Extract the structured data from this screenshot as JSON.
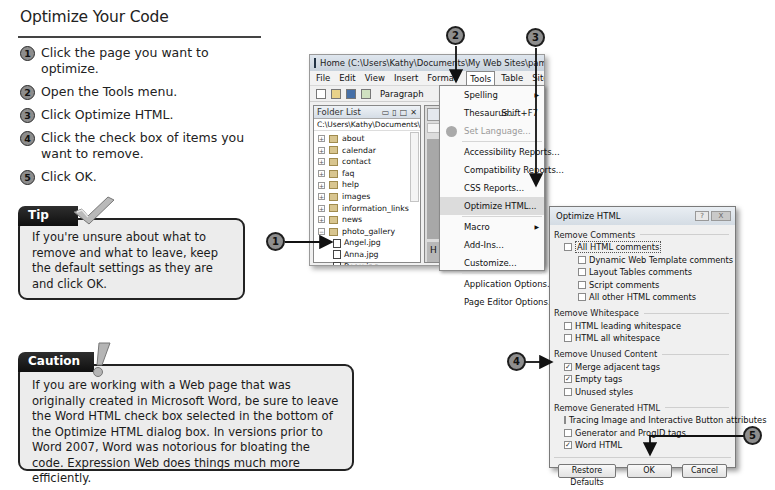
{
  "title": "Optimize Your Code",
  "steps": [
    {
      "num": "1",
      "text": "Click the page you want to optimize."
    },
    {
      "num": "2",
      "text": "Open the Tools menu."
    },
    {
      "num": "3",
      "text": "Click Optimize HTML."
    },
    {
      "num": "4",
      "text": "Click the check box of items you want to remove."
    },
    {
      "num": "5",
      "text": "Click OK."
    }
  ],
  "tip": {
    "heading": "Tip",
    "icon": "checkmark-icon",
    "text": "If you're unsure about what to remove and what to leave, keep the default settings as they are and click OK."
  },
  "caution": {
    "heading": "Caution",
    "icon": "exclamation-icon",
    "text": "If you are working with a Web page that was originally created in Microsoft Word, be sure to leave the Word HTML check box selected in the bottom of the Optimize HTML dialog box. In versions prior to Word 2007, Word was notorious for bloating the code. Expression Web does things much more efficiently."
  },
  "app": {
    "window_title": "Home (C:\\Users\\Kathy\\Documents\\My Web Sites\\pampered_pooches\\def",
    "menubar": [
      "File",
      "Edit",
      "View",
      "Insert",
      "Format",
      "Tools",
      "Table",
      "Site",
      "Data View"
    ],
    "toolbar": {
      "style_select": "Paragraph"
    },
    "folder_list": {
      "title": "Folder List",
      "path": "C:\\Users\\Kathy\\Documents\\M",
      "folders": [
        "about",
        "calendar",
        "contact",
        "faq",
        "help",
        "images",
        "information_links",
        "news",
        "photo_gallery"
      ],
      "files": [
        "Angel.jpg",
        "Anna.jpg",
        "Beau.jpg"
      ]
    },
    "editor": {
      "heading_fragment": "H"
    }
  },
  "tools_menu": {
    "items": [
      {
        "label": "Spelling",
        "shortcut": "",
        "submenu": true
      },
      {
        "label": "Thesaurus...",
        "shortcut": "Shift+F7"
      },
      {
        "label": "Set Language...",
        "disabled": true
      },
      {
        "label": "Accessibility Reports..."
      },
      {
        "label": "Compatibility Reports..."
      },
      {
        "label": "CSS Reports..."
      },
      {
        "label": "Optimize HTML...",
        "highlighted": true
      },
      {
        "label": "Macro",
        "submenu": true
      },
      {
        "label": "Add-Ins..."
      },
      {
        "label": "Customize..."
      },
      {
        "label": "Application Options..."
      },
      {
        "label": "Page Editor Options..."
      }
    ]
  },
  "dialog": {
    "title": "Optimize HTML",
    "help_label": "?",
    "close_label": "X",
    "sections": {
      "comments": {
        "label": "Remove Comments",
        "all": {
          "label": "All HTML comments",
          "checked": false
        },
        "items": [
          {
            "label": "Dynamic Web Template comments",
            "checked": false
          },
          {
            "label": "Layout Tables comments",
            "checked": false
          },
          {
            "label": "Script comments",
            "checked": false
          },
          {
            "label": "All other HTML comments",
            "checked": false
          }
        ]
      },
      "whitespace": {
        "label": "Remove Whitespace",
        "items": [
          {
            "label": "HTML leading whitespace",
            "checked": false
          },
          {
            "label": "HTML all whitespace",
            "checked": false
          }
        ]
      },
      "unused": {
        "label": "Remove Unused Content",
        "items": [
          {
            "label": "Merge adjacent tags",
            "checked": true
          },
          {
            "label": "Empty tags",
            "checked": true
          },
          {
            "label": "Unused styles",
            "checked": false
          }
        ]
      },
      "generated": {
        "label": "Remove Generated HTML",
        "items": [
          {
            "label": "Tracing Image and Interactive Button attributes",
            "checked": false
          },
          {
            "label": "Generator and ProgID tags",
            "checked": false
          },
          {
            "label": "Word HTML",
            "checked": true
          }
        ]
      }
    },
    "buttons": {
      "restore": "Restore Defaults",
      "ok": "OK",
      "cancel": "Cancel"
    },
    "check_mark": "✓"
  },
  "callouts": [
    "1",
    "2",
    "3",
    "4",
    "5"
  ]
}
